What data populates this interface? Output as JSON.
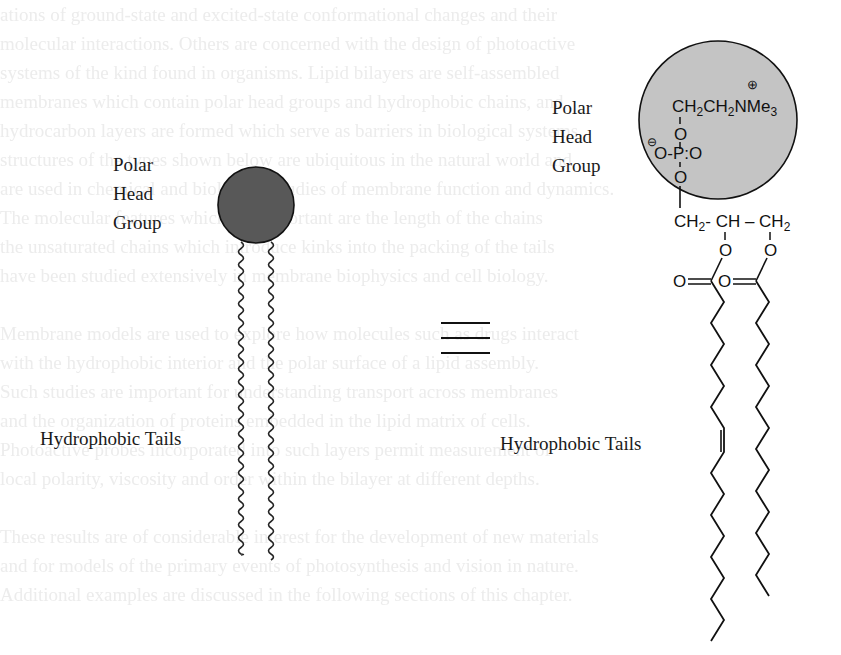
{
  "background_bleed_text": [
    "ations of ground-state and excited-state conformational changes and their",
    "molecular interactions. Others are concerned with the design of photoactive",
    "systems of the kind found in organisms. Lipid bilayers are self-assembled",
    "membranes which contain polar head groups and hydrophobic chains, and",
    "hydrocarbon layers are formed which serve as barriers in biological systems.",
    "structures of the types shown below are ubiquitous in the natural world and",
    "are used in chemical and biological studies of membrane function and dynamics.",
    "The molecular features which are important are the length of the chains",
    "the unsaturated chains which introduce kinks into the packing of the tails",
    "have been studied extensively in membrane biophysics and cell biology.",
    "",
    "Membrane models are used to explore how molecules such as drugs interact",
    "with the hydrophobic interior and the polar surface of a lipid assembly.",
    "Such studies are important for understanding transport across membranes",
    "and the organization of proteins embedded in the lipid matrix of cells.",
    "Photoactive probes incorporated into such layers permit measurement of",
    "local polarity, viscosity and order within the bilayer at different depths.",
    "",
    "These results are of considerable interest for the development of new materials",
    "and for models of the primary events of photosynthesis and vision in nature.",
    "Additional examples are discussed in the following sections of this chapter."
  ],
  "left_diagram": {
    "head_label_lines": [
      "Polar",
      "Head",
      "Group"
    ],
    "tail_label": "Hydrophobic Tails",
    "head_color": "#585858"
  },
  "equivalence_symbol": "≡",
  "right_diagram": {
    "head_label_lines": [
      "Polar",
      "Head",
      "Group"
    ],
    "tail_label": "Hydrophobic Tails",
    "head_color": "#c4c4c4",
    "choline_group": "CH₂CH₂NMe₃",
    "choline_charge": "⊕",
    "phosphate_charge": "⊖",
    "phosphate_atoms": {
      "o_top": "O",
      "o_left": "O-",
      "p": "P",
      "double_bond": ":",
      "o_right": "O",
      "o_bottom": "O"
    },
    "glycerol_backbone": [
      "CH₂",
      "-",
      "CH",
      "–",
      "CH₂"
    ],
    "ester_oxygens": [
      "O",
      "O"
    ],
    "carbonyl_oxygens": [
      "O",
      "O"
    ],
    "tails": [
      {
        "name": "unsaturated-chain",
        "has_cis_double_bond": true
      },
      {
        "name": "saturated-chain",
        "has_cis_double_bond": false
      }
    ]
  }
}
